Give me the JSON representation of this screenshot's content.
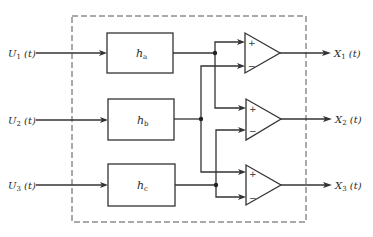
{
  "diagram": {
    "inputs": [
      {
        "id": "U1",
        "symbol": "U",
        "sub": "1",
        "arg": " (t)"
      },
      {
        "id": "U2",
        "symbol": "U",
        "sub": "2",
        "arg": " (t)"
      },
      {
        "id": "U3",
        "symbol": "U",
        "sub": "3",
        "arg": " (t)"
      }
    ],
    "blocks": [
      {
        "id": "ha",
        "symbol": "h",
        "sub": "a"
      },
      {
        "id": "hb",
        "symbol": "h",
        "sub": "b"
      },
      {
        "id": "hc",
        "symbol": "h",
        "sub": "c"
      }
    ],
    "amplifiers": [
      {
        "id": "amp1",
        "plus_input": "ha",
        "minus_input": "hb",
        "plus_sign": "+",
        "minus_sign": "−"
      },
      {
        "id": "amp2",
        "plus_input": "ha",
        "minus_input": "hc",
        "plus_sign": "+",
        "minus_sign": "−"
      },
      {
        "id": "amp3",
        "plus_input": "hb",
        "minus_input": "hc",
        "plus_sign": "+",
        "minus_sign": "−"
      }
    ],
    "outputs": [
      {
        "id": "X1",
        "symbol": "X",
        "sub": "1",
        "arg": " (t)"
      },
      {
        "id": "X2",
        "symbol": "X",
        "sub": "2",
        "arg": " (t)"
      },
      {
        "id": "X3",
        "symbol": "X",
        "sub": "3",
        "arg": " (t)"
      }
    ],
    "boundary": "dashed"
  }
}
